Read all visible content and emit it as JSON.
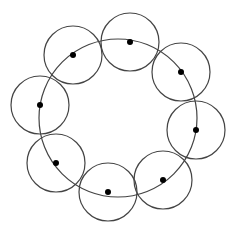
{
  "diagram": {
    "stroke_color": "#444444",
    "dot_color": "#000000",
    "background": "#ffffff",
    "main_circle": {
      "cx": 118,
      "cy": 118,
      "r": 79
    },
    "small_circle_radius": 29,
    "dot_radius": 3,
    "nodes": [
      {
        "id": "top",
        "cx": 130,
        "cy": 42
      },
      {
        "id": "upper-right",
        "cx": 181,
        "cy": 72
      },
      {
        "id": "right",
        "cx": 196,
        "cy": 130
      },
      {
        "id": "lower-right",
        "cx": 163,
        "cy": 180
      },
      {
        "id": "bottom",
        "cx": 108,
        "cy": 192
      },
      {
        "id": "lower-left",
        "cx": 56,
        "cy": 163
      },
      {
        "id": "left",
        "cx": 40,
        "cy": 105
      },
      {
        "id": "upper-left",
        "cx": 73,
        "cy": 55
      }
    ]
  }
}
